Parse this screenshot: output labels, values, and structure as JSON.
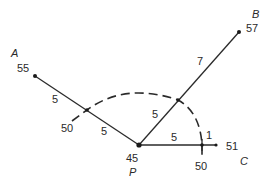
{
  "diagram": {
    "type": "contour interpolation / distance construction",
    "background": "#ffffff",
    "line_color": "#2a2a2a",
    "points": {
      "A": {
        "name": "A",
        "value": "55"
      },
      "B": {
        "name": "B",
        "value": "57"
      },
      "C": {
        "name": "C",
        "value": "51"
      },
      "P": {
        "name": "P",
        "value": "45"
      }
    },
    "segment_labels": {
      "PA_outer": "5",
      "PA_inner": "5",
      "PB_outer": "7",
      "PB_inner": "5",
      "PC_inner": "5",
      "PC_outer": "1"
    },
    "arc_intersections": {
      "on_PA": "50",
      "on_PC": "50"
    },
    "arc": {
      "style": "dashed",
      "radius_units": "5",
      "center": "P"
    }
  }
}
